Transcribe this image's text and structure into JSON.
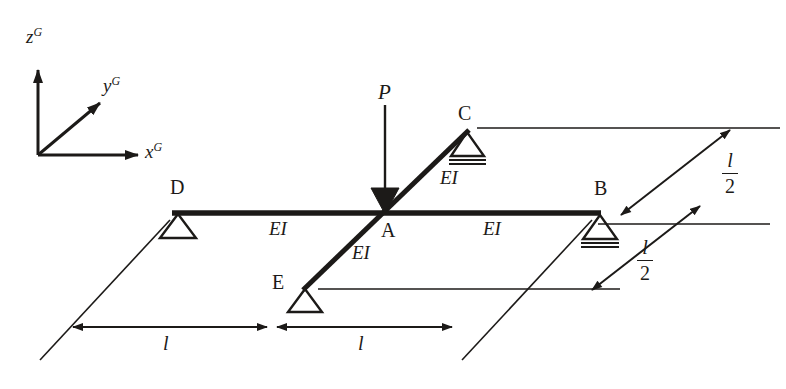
{
  "figure": {
    "background_color": "#ffffff",
    "line_color": "#1c1a18",
    "axes": {
      "z": {
        "symbol": "z",
        "superscript": "G"
      },
      "y": {
        "symbol": "y",
        "superscript": "G"
      },
      "x": {
        "symbol": "x",
        "superscript": "G"
      }
    },
    "nodes": [
      {
        "id": "A",
        "label": "A",
        "support": "none",
        "x": 385,
        "y": 213
      },
      {
        "id": "B",
        "label": "B",
        "support": "roller",
        "x": 600,
        "y": 213
      },
      {
        "id": "C",
        "label": "C",
        "support": "roller",
        "x": 467,
        "y": 131
      },
      {
        "id": "D",
        "label": "D",
        "support": "pin",
        "x": 178,
        "y": 212
      },
      {
        "id": "E",
        "label": "E",
        "support": "pin",
        "x": 305,
        "y": 288
      }
    ],
    "members": [
      {
        "id": "DA",
        "label": "EI"
      },
      {
        "id": "AB",
        "label": "EI"
      },
      {
        "id": "AC",
        "label": "EI"
      },
      {
        "id": "EA",
        "label": "EI"
      }
    ],
    "load": {
      "label": "P",
      "direction": "down",
      "applied_at": "A"
    },
    "dimensions": [
      {
        "id": "dim-left",
        "label": "l"
      },
      {
        "id": "dim-right",
        "label": "l"
      },
      {
        "id": "dim-upper-right",
        "numerator": "l",
        "denominator": "2"
      },
      {
        "id": "dim-lower-right",
        "numerator": "l",
        "denominator": "2"
      }
    ]
  }
}
